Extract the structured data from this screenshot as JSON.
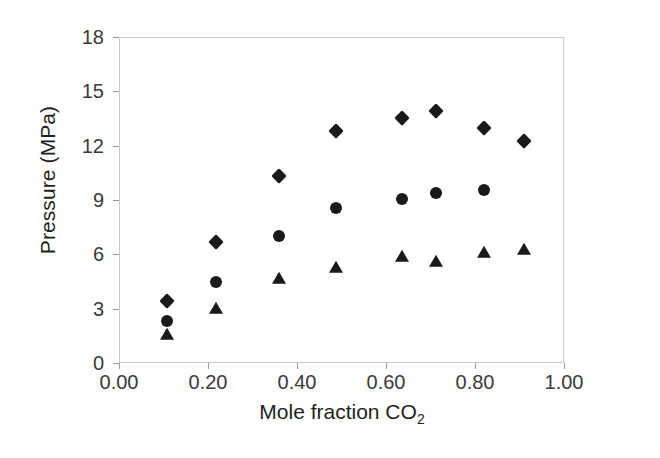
{
  "chart_data": {
    "type": "scatter",
    "title": "",
    "xlabel": "Mole fraction CO2",
    "xlabel_base": "Mole fraction CO",
    "xlabel_sub": "2",
    "ylabel": "Pressure (MPa)",
    "xlim": [
      0.0,
      1.0
    ],
    "ylim": [
      0,
      18
    ],
    "xticks": [
      "0.00",
      "0.20",
      "0.40",
      "0.60",
      "0.80",
      "1.00"
    ],
    "xtick_values": [
      0.0,
      0.2,
      0.4,
      0.6,
      0.8,
      1.0
    ],
    "yticks": [
      "0",
      "3",
      "6",
      "9",
      "12",
      "15",
      "18"
    ],
    "ytick_values": [
      0,
      3,
      6,
      9,
      12,
      15,
      18
    ],
    "grid": false,
    "legend": "none",
    "marker_color": "#1a1a1a",
    "frame_color": "#c9c9c9",
    "series": [
      {
        "name": "diamond-series",
        "marker": "diamond",
        "color": "#1a1a1a",
        "x": [
          0.107,
          0.218,
          0.36,
          0.488,
          0.637,
          0.712,
          0.82,
          0.91
        ],
        "y": [
          3.45,
          6.7,
          10.35,
          12.8,
          13.55,
          13.9,
          13.0,
          12.25
        ]
      },
      {
        "name": "circle-series",
        "marker": "circle",
        "color": "#1a1a1a",
        "x": [
          0.107,
          0.218,
          0.36,
          0.488,
          0.637,
          0.712,
          0.82
        ],
        "y": [
          2.3,
          4.5,
          7.0,
          8.55,
          9.05,
          9.4,
          9.55
        ]
      },
      {
        "name": "triangle-series",
        "marker": "triangle",
        "color": "#1a1a1a",
        "x": [
          0.107,
          0.218,
          0.36,
          0.488,
          0.637,
          0.712,
          0.82,
          0.91
        ],
        "y": [
          1.55,
          3.0,
          4.65,
          5.25,
          5.85,
          5.55,
          6.1,
          6.25
        ]
      }
    ]
  }
}
